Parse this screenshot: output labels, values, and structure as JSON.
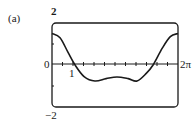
{
  "panel_label": "(a)",
  "chart_data": {
    "type": "line",
    "title": "",
    "xlabel": "",
    "ylabel": "",
    "xlim": [
      0,
      6.2832
    ],
    "ylim": [
      -2,
      2
    ],
    "grid": false,
    "x_tick_labels": {
      "left": "0",
      "one": "1",
      "right": "2π"
    },
    "y_tick_labels": {
      "top": "2",
      "bottom": "−2"
    },
    "x_minor_ticks": 12,
    "series": [
      {
        "name": "f(x)",
        "x": [
          0,
          0.4,
          0.8,
          1.15,
          1.6,
          2.14,
          2.7,
          3.24,
          3.8,
          4.24,
          4.7,
          5.04,
          5.5,
          5.9,
          6.2832
        ],
        "y": [
          1.5,
          1.3,
          0.6,
          0.0,
          -0.55,
          -0.76,
          -0.65,
          -0.57,
          -0.65,
          -0.76,
          -0.4,
          0.0,
          0.8,
          1.35,
          1.5
        ]
      }
    ]
  }
}
